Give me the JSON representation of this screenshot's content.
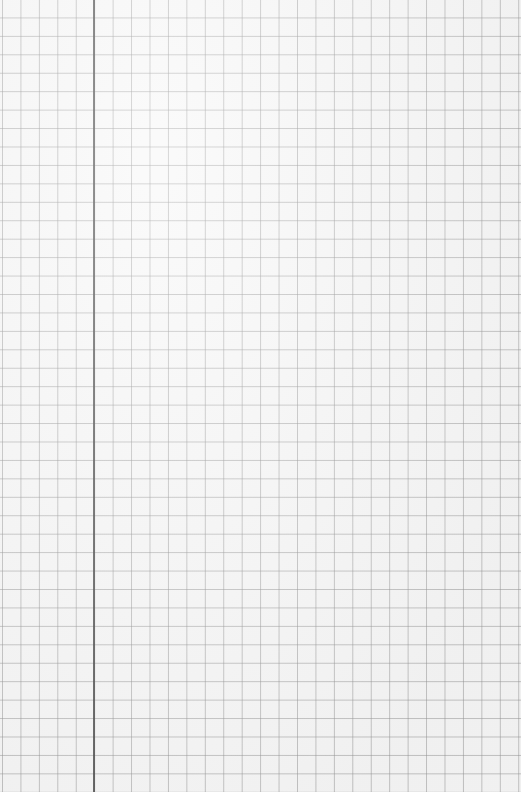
{
  "page": {
    "description": "Blank graph paper sheet",
    "grid": {
      "cell_size_px": 18.45,
      "line_color": "#c4c4c4",
      "background_color": "#f8f8f8"
    },
    "margin_line": {
      "x_px": 93,
      "color": "#4a4a4a"
    }
  }
}
